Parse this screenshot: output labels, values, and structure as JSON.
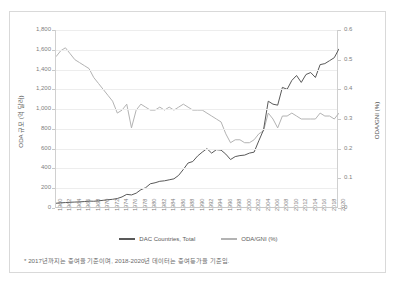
{
  "figure": {
    "footnote": "* 2017년까지는 증여율 기준이며, 2018-2020년 데이터는 증여등가율 기준임."
  },
  "legend": {
    "position": "bottom-center",
    "items": [
      {
        "label": "DAC Countries, Total",
        "color": "#595959"
      },
      {
        "label": "ODA/GNI (%)",
        "color": "#b3b3b3"
      }
    ]
  },
  "chart_data": {
    "type": "line",
    "title": "",
    "xlabel": "",
    "ylabel": "ODA 규모 (억 달러)",
    "y2label": "ODA/GNI (%)",
    "grid": true,
    "xlim": [
      1960,
      2020
    ],
    "ylim": [
      0,
      1800
    ],
    "y2lim": [
      0,
      0.6
    ],
    "yticks": [
      "0",
      "200",
      "400",
      "600",
      "800",
      "1,000",
      "1,200",
      "1,400",
      "1,600",
      "1,800"
    ],
    "ytick_values": [
      0,
      200,
      400,
      600,
      800,
      1000,
      1200,
      1400,
      1600,
      1800
    ],
    "y2ticks": [
      "0",
      "0.1",
      "0.2",
      "0.3",
      "0.4",
      "0.5",
      "0.6"
    ],
    "y2tick_values": [
      0,
      0.1,
      0.2,
      0.3,
      0.4,
      0.5,
      0.6
    ],
    "x": [
      1960,
      1961,
      1962,
      1963,
      1964,
      1965,
      1966,
      1967,
      1968,
      1969,
      1970,
      1971,
      1972,
      1973,
      1974,
      1975,
      1976,
      1977,
      1978,
      1979,
      1980,
      1981,
      1982,
      1983,
      1984,
      1985,
      1986,
      1987,
      1988,
      1989,
      1990,
      1991,
      1992,
      1993,
      1994,
      1995,
      1996,
      1997,
      1998,
      1999,
      2000,
      2001,
      2002,
      2003,
      2004,
      2005,
      2006,
      2007,
      2008,
      2009,
      2010,
      2011,
      2012,
      2013,
      2014,
      2015,
      2016,
      2017,
      2018,
      2019,
      2020
    ],
    "xtick_labels": [
      "1960",
      "1962",
      "1964",
      "1966",
      "1968",
      "1970",
      "1972",
      "1974",
      "1976",
      "1978",
      "1980",
      "1982",
      "1984",
      "1986",
      "1988",
      "1990",
      "1992",
      "1994",
      "1996",
      "1998",
      "2000",
      "2002",
      "2004",
      "2006",
      "2008",
      "2010",
      "2012",
      "2014",
      "2016",
      "2018",
      "2020"
    ],
    "series": [
      {
        "name": "DAC Countries, Total",
        "axis": "left",
        "color": "#595959",
        "unit": "억 달러",
        "values": [
          48,
          52,
          55,
          58,
          60,
          62,
          65,
          70,
          68,
          72,
          78,
          83,
          88,
          96,
          112,
          138,
          132,
          150,
          185,
          205,
          245,
          255,
          270,
          275,
          285,
          295,
          330,
          390,
          455,
          470,
          525,
          565,
          600,
          555,
          590,
          585,
          545,
          490,
          520,
          530,
          535,
          555,
          565,
          680,
          790,
          1080,
          1050,
          1040,
          1220,
          1200,
          1290,
          1340,
          1270,
          1350,
          1370,
          1320,
          1450,
          1460,
          1490,
          1520,
          1610
        ]
      },
      {
        "name": "ODA/GNI (%)",
        "axis": "right",
        "color": "#b3b3b3",
        "unit": "%",
        "values": [
          0.51,
          0.53,
          0.54,
          0.52,
          0.5,
          0.49,
          0.48,
          0.47,
          0.44,
          0.42,
          0.4,
          0.38,
          0.36,
          0.32,
          0.33,
          0.35,
          0.27,
          0.33,
          0.35,
          0.34,
          0.33,
          0.33,
          0.34,
          0.33,
          0.34,
          0.33,
          0.34,
          0.35,
          0.34,
          0.33,
          0.33,
          0.33,
          0.32,
          0.31,
          0.3,
          0.29,
          0.25,
          0.22,
          0.23,
          0.23,
          0.22,
          0.22,
          0.23,
          0.25,
          0.26,
          0.32,
          0.3,
          0.27,
          0.31,
          0.31,
          0.32,
          0.31,
          0.3,
          0.3,
          0.3,
          0.3,
          0.32,
          0.31,
          0.31,
          0.3,
          0.32
        ]
      }
    ]
  }
}
